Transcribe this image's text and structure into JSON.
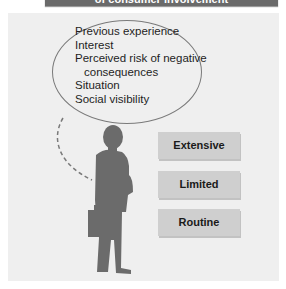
{
  "header": {
    "title": "of consumer involvement",
    "color": "#6a6a6a"
  },
  "bubble": {
    "factors": [
      "Previous experience",
      "Interest",
      "Perceived risk of negative",
      "consequences",
      "Situation",
      "Social visibility"
    ]
  },
  "figure": {
    "icon": "businessman-silhouette-icon",
    "color": "#6b6b6b"
  },
  "levels": [
    {
      "label": "Extensive"
    },
    {
      "label": "Limited"
    },
    {
      "label": "Routine"
    }
  ]
}
